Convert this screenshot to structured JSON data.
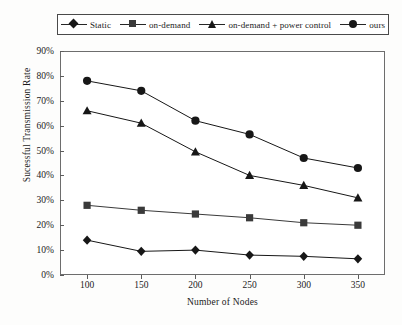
{
  "chart_data": {
    "type": "line",
    "title": "",
    "xlabel": "Number of Nodes",
    "ylabel": "Sucessful Transmission Rate",
    "x": [
      100,
      150,
      200,
      250,
      300,
      350
    ],
    "xtick_labels": [
      "100",
      "150",
      "200",
      "250",
      "300",
      "350"
    ],
    "ytick_labels": [
      "0%",
      "10%",
      "20%",
      "30%",
      "40%",
      "50%",
      "60%",
      "70%",
      "80%",
      "90%"
    ],
    "ytick_values": [
      0,
      10,
      20,
      30,
      40,
      50,
      60,
      70,
      80,
      90
    ],
    "ylim": [
      0,
      90
    ],
    "xlim": [
      75,
      375
    ],
    "grid": false,
    "legend_position": "top",
    "series": [
      {
        "name": "Static",
        "marker": "diamond",
        "color": "#171717",
        "values": [
          14,
          9.5,
          10,
          8,
          7.5,
          6.5
        ]
      },
      {
        "name": "on-demand",
        "marker": "square",
        "color": "#3a3a3a",
        "values": [
          28,
          26,
          24.5,
          23,
          21,
          20
        ]
      },
      {
        "name": "on-demand + power control",
        "marker": "triangle",
        "color": "#171717",
        "values": [
          66,
          61,
          49.5,
          40,
          36,
          31
        ]
      },
      {
        "name": "ours",
        "marker": "circle",
        "color": "#171717",
        "values": [
          78,
          74,
          62,
          56.5,
          47,
          43
        ]
      }
    ]
  }
}
